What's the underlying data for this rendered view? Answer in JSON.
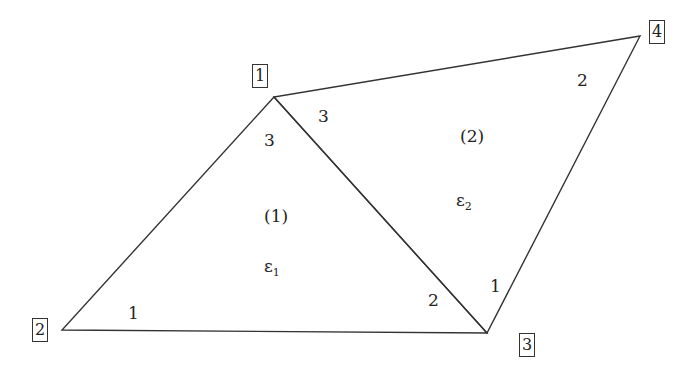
{
  "nodes": [
    {
      "id": "1",
      "x": 274,
      "y": 97
    },
    {
      "id": "2",
      "x": 62,
      "y": 330
    },
    {
      "id": "3",
      "x": 487,
      "y": 333
    },
    {
      "id": "4",
      "x": 640,
      "y": 36
    }
  ],
  "node_labels": {
    "n1": "1",
    "n2": "2",
    "n3": "3",
    "n4": "4"
  },
  "elements": [
    {
      "id": "(1)",
      "strain": "ε",
      "strain_sub": "1",
      "local_nodes": {
        "node1": "3",
        "node2": "1",
        "node3": "2"
      }
    },
    {
      "id": "(2)",
      "strain": "ε",
      "strain_sub": "2",
      "local_nodes": {
        "node1": "3",
        "node3": "1",
        "node4": "2"
      }
    }
  ],
  "line_color": "#333333"
}
